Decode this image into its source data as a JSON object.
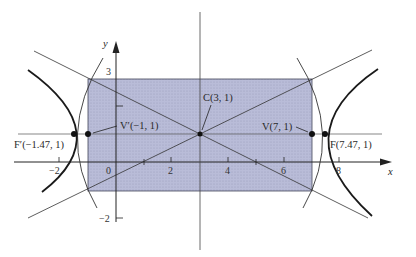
{
  "diagram": {
    "type": "hyperbola",
    "axes": {
      "x_label": "x",
      "y_label": "y",
      "x_ticks": [
        "−2",
        "0",
        "2",
        "4",
        "6",
        "8"
      ],
      "y_ticks": [
        "3",
        "−2"
      ]
    },
    "points": {
      "center": "C(3, 1)",
      "vertex_right": "V(7, 1)",
      "vertex_left": "V′(−1, 1)",
      "focus_right": "F(7.47, 1)",
      "focus_left": "F′(−1.47, 1)"
    },
    "colors": {
      "box_fill": "#b9bcd8",
      "box_stroke": "#44465a",
      "curve": "#1a1a1a",
      "line": "#333333"
    }
  }
}
